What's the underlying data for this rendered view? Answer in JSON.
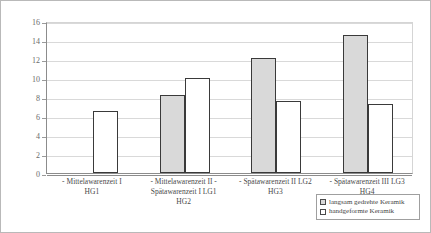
{
  "chart_data": {
    "type": "bar",
    "title": "",
    "xlabel": "",
    "ylabel": "",
    "ylim": [
      0,
      16
    ],
    "ytick_step": 2,
    "ytick_labels": [
      "0",
      "2",
      "4",
      "6",
      "8",
      "10",
      "12",
      "14",
      "16"
    ],
    "grid": true,
    "legend_position": "bottom-right",
    "categories": [
      [
        "- Mittelawarenzeit I",
        "HG1"
      ],
      [
        "- Mittelawarenzeit II -",
        "Spätawarenzeit I LG1",
        "HG2"
      ],
      [
        "- Spätawarenzeit II LG2",
        "HG3"
      ],
      [
        "- Spätawarenzeit III LG3",
        "HG4"
      ]
    ],
    "series": [
      {
        "name": "langsam gedrehte Keramik",
        "color": "#d9d9d9",
        "values": [
          null,
          8.2,
          12.1,
          14.5
        ]
      },
      {
        "name": "handgeformte Keramik",
        "color": "#ffffff",
        "values": [
          6.5,
          10.0,
          7.6,
          7.3
        ]
      }
    ]
  },
  "legend": {
    "entries": [
      {
        "label": "langsam gedrehte Keramik"
      },
      {
        "label": "handgeformte Keramik"
      }
    ]
  }
}
